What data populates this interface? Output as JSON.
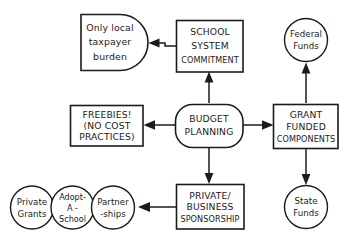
{
  "diagram": {
    "type": "flowchart",
    "background_color": "#ffffff",
    "line_color": "#1b1b1b",
    "nodes": {
      "budget_planning": {
        "id": "budget-planning",
        "shape": "rounded-rectangle",
        "lines": [
          "BUDGET",
          "PLANNING"
        ]
      },
      "school_system_commitment": {
        "id": "school-system-commitment",
        "shape": "rectangle",
        "lines": [
          "SCHOOL",
          "SYSTEM",
          "COMMITMENT"
        ]
      },
      "only_local_taxpayer_burden": {
        "id": "only-local-taxpayer-burden",
        "shape": "d-shape",
        "lines": [
          "Only local",
          "taxpayer",
          "burden"
        ]
      },
      "freebies": {
        "id": "freebies-no-cost-practices",
        "shape": "rectangle",
        "lines": [
          "FREEBIES!",
          "(NO COST",
          "PRACTICES)"
        ]
      },
      "grant_funded_components": {
        "id": "grant-funded-components",
        "shape": "rectangle",
        "lines": [
          "GRANT",
          "FUNDED",
          "COMPONENTS"
        ]
      },
      "federal_funds": {
        "id": "federal-funds",
        "shape": "circle",
        "lines": [
          "Federal",
          "Funds"
        ]
      },
      "state_funds": {
        "id": "state-funds",
        "shape": "circle",
        "lines": [
          "State",
          "Funds"
        ]
      },
      "private_business_sponsorship": {
        "id": "private-business-sponsorship",
        "shape": "rectangle",
        "lines": [
          "PRIVATE/",
          "BUSINESS",
          "SPONSORSHIP"
        ]
      },
      "partnerships": {
        "id": "partnerships",
        "shape": "circle",
        "lines": [
          "Partner",
          "-ships"
        ]
      },
      "adopt_a_school": {
        "id": "adopt-a-school",
        "shape": "circle",
        "lines": [
          "Adopt-",
          "A -",
          "School"
        ]
      },
      "private_grants": {
        "id": "private-grants",
        "shape": "circle",
        "lines": [
          "Private",
          "Grants"
        ]
      }
    },
    "edges": [
      {
        "from": "budget_planning",
        "to": "school_system_commitment",
        "direction": "up"
      },
      {
        "from": "school_system_commitment",
        "to": "only_local_taxpayer_burden",
        "direction": "left"
      },
      {
        "from": "budget_planning",
        "to": "freebies",
        "direction": "left"
      },
      {
        "from": "budget_planning",
        "to": "grant_funded_components",
        "direction": "right"
      },
      {
        "from": "grant_funded_components",
        "to": "federal_funds",
        "direction": "up"
      },
      {
        "from": "grant_funded_components",
        "to": "state_funds",
        "direction": "down"
      },
      {
        "from": "budget_planning",
        "to": "private_business_sponsorship",
        "direction": "down"
      },
      {
        "from": "private_business_sponsorship",
        "to": "partnerships",
        "direction": "left"
      }
    ]
  }
}
